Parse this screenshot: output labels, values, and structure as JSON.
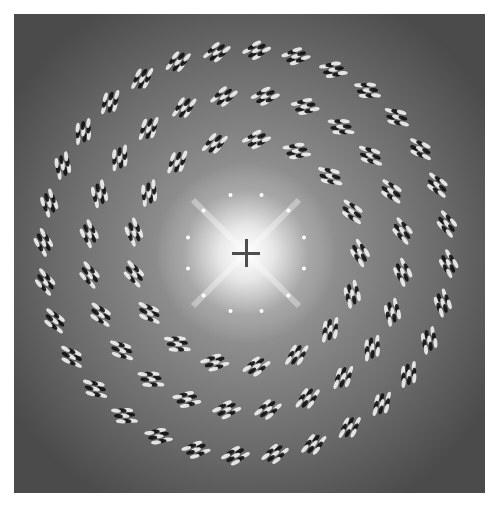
{
  "image": {
    "kind": "diffraction-pattern",
    "frame": {
      "left": 14,
      "top": 14,
      "width": 471,
      "height": 479
    },
    "background_color": "#4b4b4b",
    "halo_color": "#7a7a7a",
    "center": {
      "x": 232,
      "y": 239
    },
    "center_glow": {
      "radius": 90,
      "color": "#ffffff"
    },
    "rings": [
      {
        "name": "inner",
        "radius": 114,
        "count": 17,
        "offset_deg": 0
      },
      {
        "name": "middle",
        "radius": 158,
        "count": 24,
        "offset_deg": 7
      },
      {
        "name": "outer",
        "radius": 203,
        "count": 32,
        "offset_deg": 3
      }
    ],
    "spot_color_light": "#f2f2f2",
    "spot_color_dark": "#111111"
  },
  "crosshair": {
    "x": 232,
    "y": 239,
    "arm": 14,
    "thickness": 3,
    "color": "#4e4e4e"
  }
}
